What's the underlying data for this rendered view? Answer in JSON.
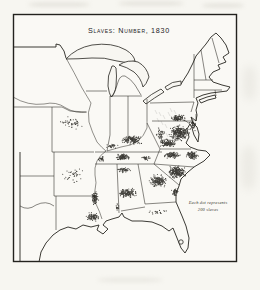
{
  "figure": {
    "title": "Slaves: Number, 1830",
    "legend_line1": "Each dot represents",
    "legend_line2": "200 slaves"
  },
  "map": {
    "type": "dot-density",
    "year_shown": "1830",
    "dot_value": 200,
    "dot_unit": "slaves",
    "ink_color": "#1e1d18",
    "paper_color": "#f7f6f1",
    "dot_radius": 0.55,
    "dot_opacity": 0.85,
    "seed": 1830,
    "clusters": [
      {
        "name": "tidewater-virginia",
        "cx": 179,
        "cy": 133,
        "rx": 11,
        "ry": 9,
        "n": 300
      },
      {
        "name": "virginia-southside",
        "cx": 168,
        "cy": 143,
        "rx": 10,
        "ry": 5,
        "n": 140
      },
      {
        "name": "northern-virginia-maryland",
        "cx": 178,
        "cy": 118,
        "rx": 9,
        "ry": 4,
        "n": 80
      },
      {
        "name": "chesapeake-eastern-shore",
        "cx": 193,
        "cy": 125,
        "rx": 4,
        "ry": 7,
        "n": 40
      },
      {
        "name": "eastern-north-carolina",
        "cx": 192,
        "cy": 155,
        "rx": 8,
        "ry": 5,
        "n": 110
      },
      {
        "name": "north-carolina-piedmont",
        "cx": 172,
        "cy": 155,
        "rx": 10,
        "ry": 4,
        "n": 110
      },
      {
        "name": "south-carolina",
        "cx": 177,
        "cy": 172,
        "rx": 11,
        "ry": 7,
        "n": 240
      },
      {
        "name": "georgia-piedmont",
        "cx": 158,
        "cy": 181,
        "rx": 10,
        "ry": 7,
        "n": 170
      },
      {
        "name": "georgia-coast",
        "cx": 175,
        "cy": 192,
        "rx": 4,
        "ry": 5,
        "n": 45
      },
      {
        "name": "central-kentucky",
        "cx": 132,
        "cy": 140,
        "rx": 13,
        "ry": 5,
        "n": 150
      },
      {
        "name": "west-kentucky",
        "cx": 112,
        "cy": 146,
        "rx": 7,
        "ry": 3,
        "n": 30
      },
      {
        "name": "middle-tennessee",
        "cx": 123,
        "cy": 157,
        "rx": 8,
        "ry": 4,
        "n": 110
      },
      {
        "name": "east-tennessee-valley",
        "cx": 146,
        "cy": 158,
        "rx": 5,
        "ry": 3,
        "n": 30
      },
      {
        "name": "west-tennessee",
        "cx": 101,
        "cy": 159,
        "rx": 4,
        "ry": 3,
        "n": 30
      },
      {
        "name": "north-alabama",
        "cx": 124,
        "cy": 170,
        "rx": 8,
        "ry": 3,
        "n": 50
      },
      {
        "name": "alabama-black-belt",
        "cx": 127,
        "cy": 193,
        "rx": 11,
        "ry": 6,
        "n": 150
      },
      {
        "name": "mississippi-natchez",
        "cx": 95,
        "cy": 198,
        "rx": 4,
        "ry": 9,
        "n": 90
      },
      {
        "name": "louisiana-sugar-coast",
        "cx": 93,
        "cy": 217,
        "rx": 8,
        "ry": 5,
        "n": 90
      },
      {
        "name": "mobile",
        "cx": 117,
        "cy": 207,
        "rx": 3,
        "ry": 4,
        "n": 15
      },
      {
        "name": "missouri-river",
        "cx": 72,
        "cy": 123,
        "rx": 14,
        "ry": 7,
        "n": 45
      },
      {
        "name": "arkansas-scatter",
        "cx": 72,
        "cy": 175,
        "rx": 13,
        "ry": 10,
        "n": 35
      },
      {
        "name": "north-florida",
        "cx": 158,
        "cy": 212,
        "rx": 12,
        "ry": 3,
        "n": 20
      },
      {
        "name": "shenandoah-valley",
        "cx": 160,
        "cy": 134,
        "rx": 5,
        "ry": 7,
        "n": 40
      }
    ]
  }
}
